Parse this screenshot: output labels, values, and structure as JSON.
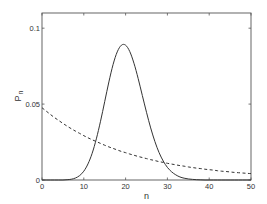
{
  "chart_data": {
    "type": "line",
    "title": "",
    "xlabel": "n",
    "ylabel": "P_n",
    "ylabel_main": "P",
    "ylabel_sub": "n",
    "xlim": [
      0,
      50
    ],
    "ylim": [
      0,
      0.11
    ],
    "grid": false,
    "legend": null,
    "x_ticks": [
      0,
      10,
      20,
      30,
      40,
      50
    ],
    "x_tick_labels": [
      "0",
      "10",
      "20",
      "30",
      "40",
      "50"
    ],
    "y_ticks": [
      0,
      0.05,
      0.1
    ],
    "y_tick_labels": [
      "0",
      "0.05",
      "0.1"
    ],
    "x": [
      0,
      1,
      2,
      3,
      4,
      5,
      6,
      7,
      8,
      9,
      10,
      11,
      12,
      13,
      14,
      15,
      16,
      17,
      18,
      19,
      20,
      21,
      22,
      23,
      24,
      25,
      26,
      27,
      28,
      29,
      30,
      31,
      32,
      33,
      34,
      35,
      36,
      37,
      38,
      39,
      40,
      41,
      42,
      43,
      44,
      45,
      46,
      47,
      48,
      49,
      50
    ],
    "series": [
      {
        "name": "Poisson (mean 20)",
        "style": "solid",
        "color": "#333333",
        "values": [
          0,
          0,
          0,
          0,
          0,
          0,
          0.0002,
          0.0005,
          0.0013,
          0.0029,
          0.0058,
          0.0106,
          0.0176,
          0.0271,
          0.0387,
          0.0516,
          0.0646,
          0.076,
          0.0844,
          0.0888,
          0.0888,
          0.0846,
          0.0769,
          0.0669,
          0.0557,
          0.0446,
          0.0343,
          0.0254,
          0.0181,
          0.0125,
          0.0083,
          0.0054,
          0.0034,
          0.002,
          0.0012,
          0.0007,
          0.0004,
          0.0002,
          0.0001,
          0,
          0,
          0,
          0,
          0,
          0,
          0,
          0,
          0,
          0,
          0,
          0
        ]
      },
      {
        "name": "Geometric (mean 20)",
        "style": "dashed",
        "color": "#333333",
        "values": [
          0.0476,
          0.0454,
          0.0432,
          0.0411,
          0.0392,
          0.0373,
          0.0355,
          0.0338,
          0.0322,
          0.0307,
          0.0292,
          0.0278,
          0.0265,
          0.0253,
          0.0241,
          0.0229,
          0.0218,
          0.0208,
          0.0198,
          0.0188,
          0.018,
          0.0171,
          0.0163,
          0.0155,
          0.0148,
          0.0141,
          0.0134,
          0.0128,
          0.0121,
          0.0116,
          0.011,
          0.0105,
          0.01,
          0.0095,
          0.0091,
          0.0086,
          0.0082,
          0.0078,
          0.0075,
          0.0071,
          0.0068,
          0.0065,
          0.0061,
          0.0058,
          0.0056,
          0.0053,
          0.005,
          0.0048,
          0.0046,
          0.0044,
          0.0042
        ]
      }
    ]
  }
}
